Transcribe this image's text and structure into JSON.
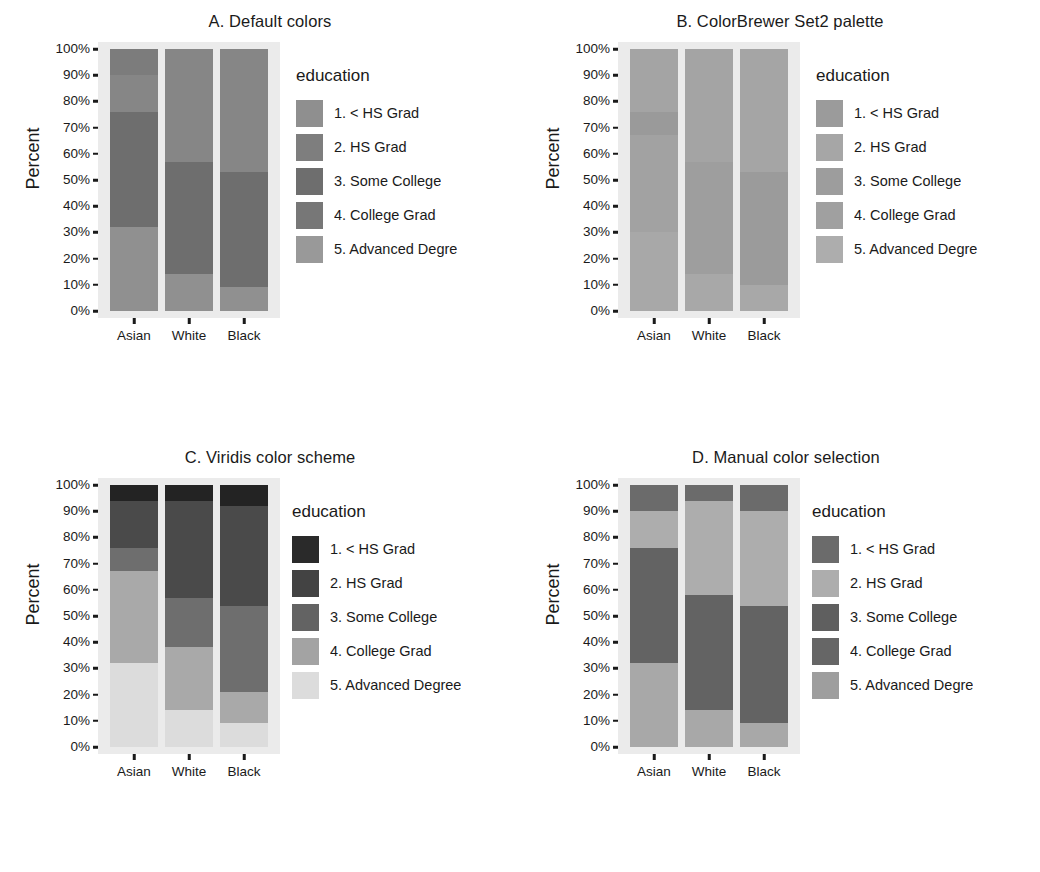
{
  "figure": {
    "ylabel": "Percent",
    "legend_title": "education",
    "y_ticks": [
      "0%",
      "10%",
      "20%",
      "30%",
      "40%",
      "50%",
      "60%",
      "70%",
      "80%",
      "90%",
      "100%"
    ],
    "y_tick_values": [
      0,
      10,
      20,
      30,
      40,
      50,
      60,
      70,
      80,
      90,
      100
    ],
    "x_ticks": [
      "Asian",
      "White",
      "Black"
    ],
    "panel_bg": "#ebebeb"
  },
  "chart_data": [
    {
      "type": "bar",
      "id": "A",
      "title": "A. Default colors",
      "stacked": true,
      "stack_normalized": true,
      "xlabel": "",
      "ylabel": "Percent",
      "ylim": [
        0,
        100
      ],
      "grid": false,
      "legend_position": "right",
      "legend_title": "education",
      "categories": [
        "Asian",
        "White",
        "Black"
      ],
      "series": [
        {
          "name": "1. < HS Grad",
          "color": "#8f8f8f",
          "values": [
            32,
            14,
            9
          ]
        },
        {
          "name": "2. HS Grad",
          "color": "#7e7e7e",
          "values": [
            44,
            44,
            44
          ]
        },
        {
          "name": "3. Some College",
          "color": "#6e6e6e",
          "values": [
            14,
            29,
            36
          ]
        },
        {
          "name": "4. College Grad",
          "color": "#777777",
          "values": [
            10,
            13,
            11
          ]
        },
        {
          "name": "5. Advanced Degre",
          "color": "#999999",
          "values": [
            0,
            0,
            0
          ]
        }
      ],
      "legend_labels": [
        "1. < HS Grad",
        "2. HS Grad",
        "3. Some College",
        "4. College Grad",
        "5. Advanced Degre"
      ],
      "legend_colors": [
        "#8f8f8f",
        "#7e7e7e",
        "#6e6e6e",
        "#777777",
        "#999999"
      ],
      "segments": {
        "Asian": [
          {
            "label": "5. Advanced Degre",
            "from": 0,
            "to": 32,
            "color": "#909090"
          },
          {
            "label": "4. College Grad",
            "from": 32,
            "to": 76,
            "color": "#6e6e6e"
          },
          {
            "label": "3. Some College",
            "from": 76,
            "to": 90,
            "color": "#868686"
          },
          {
            "label": "2. HS Grad",
            "from": 90,
            "to": 100,
            "color": "#7c7c7c"
          }
        ],
        "White": [
          {
            "label": "5. Advanced Degre",
            "from": 0,
            "to": 14,
            "color": "#909090"
          },
          {
            "label": "4. College Grad",
            "from": 14,
            "to": 57,
            "color": "#6e6e6e"
          },
          {
            "label": "3. Some College",
            "from": 57,
            "to": 100,
            "color": "#868686"
          }
        ],
        "Black": [
          {
            "label": "5. Advanced Degre",
            "from": 0,
            "to": 9,
            "color": "#909090"
          },
          {
            "label": "4. College Grad",
            "from": 9,
            "to": 53,
            "color": "#6e6e6e"
          },
          {
            "label": "3. Some College",
            "from": 53,
            "to": 100,
            "color": "#868686"
          }
        ]
      }
    },
    {
      "type": "bar",
      "id": "B",
      "title": "B. ColorBrewer Set2 palette",
      "stacked": true,
      "stack_normalized": true,
      "xlabel": "",
      "ylabel": "Percent",
      "ylim": [
        0,
        100
      ],
      "grid": false,
      "legend_position": "right",
      "legend_title": "education",
      "categories": [
        "Asian",
        "White",
        "Black"
      ],
      "legend_labels": [
        "1. < HS Grad",
        "2. HS Grad",
        "3. Some College",
        "4. College Grad",
        "5. Advanced Degre"
      ],
      "legend_colors": [
        "#9b9b9b",
        "#a6a6a6",
        "#9d9d9d",
        "#a0a0a0",
        "#adadad"
      ],
      "segments": {
        "Asian": [
          {
            "label": "5. Advanced Degre",
            "from": 0,
            "to": 30,
            "color": "#a8a8a8"
          },
          {
            "label": "4. College Grad",
            "from": 30,
            "to": 67,
            "color": "#a2a2a2"
          },
          {
            "label": "3. Some College",
            "from": 67,
            "to": 76,
            "color": "#9a9a9a"
          },
          {
            "label": "2. HS Grad",
            "from": 76,
            "to": 100,
            "color": "#a4a4a4"
          }
        ],
        "White": [
          {
            "label": "5. Advanced Degre",
            "from": 0,
            "to": 14,
            "color": "#a8a8a8"
          },
          {
            "label": "4. College Grad",
            "from": 14,
            "to": 57,
            "color": "#9e9e9e"
          },
          {
            "label": "3. Some College",
            "from": 57,
            "to": 100,
            "color": "#a4a4a4"
          }
        ],
        "Black": [
          {
            "label": "5. Advanced Degre",
            "from": 0,
            "to": 10,
            "color": "#a8a8a8"
          },
          {
            "label": "4. College Grad",
            "from": 10,
            "to": 53,
            "color": "#9b9b9b"
          },
          {
            "label": "3. Some College",
            "from": 53,
            "to": 100,
            "color": "#a5a5a5"
          }
        ]
      }
    },
    {
      "type": "bar",
      "id": "C",
      "title": "C. Viridis color scheme",
      "stacked": true,
      "stack_normalized": true,
      "xlabel": "",
      "ylabel": "Percent",
      "ylim": [
        0,
        100
      ],
      "grid": false,
      "legend_position": "right",
      "legend_title": "education",
      "categories": [
        "Asian",
        "White",
        "Black"
      ],
      "legend_labels": [
        "1. < HS Grad",
        "2. HS Grad",
        "3. Some College",
        "4. College Grad",
        "5. Advanced Degree"
      ],
      "legend_colors": [
        "#2a2a2a",
        "#434343",
        "#636363",
        "#a3a3a3",
        "#dcdcdc"
      ],
      "segments": {
        "Asian": [
          {
            "label": "5. Advanced Degree",
            "from": 0,
            "to": 32,
            "color": "#dcdcdc"
          },
          {
            "label": "4. College Grad",
            "from": 32,
            "to": 67,
            "color": "#a9a9a9"
          },
          {
            "label": "3. Some College",
            "from": 67,
            "to": 76,
            "color": "#6e6e6e"
          },
          {
            "label": "2. HS Grad",
            "from": 76,
            "to": 94,
            "color": "#4a4a4a"
          },
          {
            "label": "1. < HS Grad",
            "from": 94,
            "to": 100,
            "color": "#232323"
          }
        ],
        "White": [
          {
            "label": "5. Advanced Degree",
            "from": 0,
            "to": 14,
            "color": "#dcdcdc"
          },
          {
            "label": "4. College Grad",
            "from": 14,
            "to": 38,
            "color": "#a9a9a9"
          },
          {
            "label": "3. Some College",
            "from": 38,
            "to": 57,
            "color": "#6e6e6e"
          },
          {
            "label": "2. HS Grad",
            "from": 57,
            "to": 94,
            "color": "#4a4a4a"
          },
          {
            "label": "1. < HS Grad",
            "from": 94,
            "to": 100,
            "color": "#232323"
          }
        ],
        "Black": [
          {
            "label": "5. Advanced Degree",
            "from": 0,
            "to": 9,
            "color": "#dcdcdc"
          },
          {
            "label": "4. College Grad",
            "from": 9,
            "to": 21,
            "color": "#a9a9a9"
          },
          {
            "label": "3. Some College",
            "from": 21,
            "to": 54,
            "color": "#6e6e6e"
          },
          {
            "label": "2. HS Grad",
            "from": 54,
            "to": 92,
            "color": "#4a4a4a"
          },
          {
            "label": "1. < HS Grad",
            "from": 92,
            "to": 100,
            "color": "#232323"
          }
        ]
      }
    },
    {
      "type": "bar",
      "id": "D",
      "title": "D. Manual color selection",
      "stacked": true,
      "stack_normalized": true,
      "xlabel": "",
      "ylabel": "Percent",
      "ylim": [
        0,
        100
      ],
      "grid": false,
      "legend_position": "right",
      "legend_title": "education",
      "categories": [
        "Asian",
        "White",
        "Black"
      ],
      "legend_labels": [
        "1. < HS Grad",
        "2. HS Grad",
        "3. Some College",
        "4. College Grad",
        "5. Advanced Degre"
      ],
      "legend_colors": [
        "#6b6b6b",
        "#adadad",
        "#5f5f5f",
        "#666666",
        "#9e9e9e"
      ],
      "segments": {
        "Asian": [
          {
            "label": "5. Advanced Degre",
            "from": 0,
            "to": 32,
            "color": "#a8a8a8"
          },
          {
            "label": "4. College Grad",
            "from": 32,
            "to": 76,
            "color": "#636363"
          },
          {
            "label": "3. Some College",
            "from": 76,
            "to": 90,
            "color": "#adadad"
          },
          {
            "label": "2. HS Grad",
            "from": 90,
            "to": 100,
            "color": "#6b6b6b"
          }
        ],
        "White": [
          {
            "label": "5. Advanced Degre",
            "from": 0,
            "to": 14,
            "color": "#a8a8a8"
          },
          {
            "label": "4. College Grad",
            "from": 14,
            "to": 58,
            "color": "#636363"
          },
          {
            "label": "3. Some College",
            "from": 58,
            "to": 94,
            "color": "#adadad"
          },
          {
            "label": "2. HS Grad",
            "from": 94,
            "to": 100,
            "color": "#6b6b6b"
          }
        ],
        "Black": [
          {
            "label": "5. Advanced Degre",
            "from": 0,
            "to": 9,
            "color": "#a8a8a8"
          },
          {
            "label": "4. College Grad",
            "from": 9,
            "to": 54,
            "color": "#636363"
          },
          {
            "label": "3. Some College",
            "from": 54,
            "to": 90,
            "color": "#adadad"
          },
          {
            "label": "2. HS Grad",
            "from": 90,
            "to": 100,
            "color": "#6b6b6b"
          }
        ]
      }
    }
  ]
}
